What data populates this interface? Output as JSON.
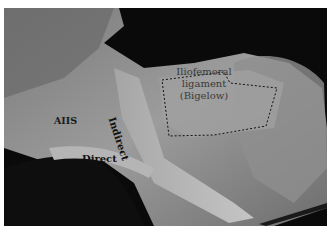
{
  "image": {
    "description": "Grayscale cadaveric dissection photograph of the hip showing the origins of the rectus femoris and the iliofemoral ligament",
    "colors": {
      "background": "#0a0a0a",
      "tissue_light": "#bdbdbd",
      "tissue_mid": "#8a8a8a",
      "tissue_dark": "#4a4a4a",
      "frame": "#ffffff"
    }
  },
  "labels": {
    "aiis": "AIIS",
    "direct": "Direct",
    "indirect": "Indirect",
    "ligament_line1": "Iliofemoral",
    "ligament_line2": "ligament",
    "ligament_line3": "(Bigelow)"
  },
  "annotations": {
    "outline_style": "dashed",
    "outlined_structure": "Iliofemoral ligament (Bigelow)"
  }
}
